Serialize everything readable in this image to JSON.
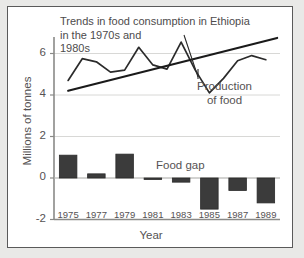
{
  "chart_data": {
    "type": "bar",
    "title": "Trends in food consumption in Ethiopia in the 1970s and 1980s",
    "title_lines": [
      "Trends in food consumption in Ethiopia",
      "in the 1970s and",
      "1980s"
    ],
    "xlabel": "Year",
    "ylabel": "Millions of tonnes",
    "categories": [
      "1975",
      "1977",
      "1979",
      "1981",
      "1983",
      "1985",
      "1987",
      "1989"
    ],
    "ylim": [
      -2,
      7
    ],
    "yticks": [
      -2,
      0,
      2,
      4,
      6
    ],
    "ytick_labels": [
      "-2",
      "0",
      "2",
      "4",
      "6"
    ],
    "grid": true,
    "legend_position": "inline-annotations",
    "series": [
      {
        "name": "Food gap",
        "type": "bar",
        "label": "Food gap",
        "color": "#3b3b3b",
        "categories": [
          "1975",
          "1977",
          "1979",
          "1981",
          "1983",
          "1985",
          "1987",
          "1989"
        ],
        "values": [
          1.1,
          0.2,
          1.15,
          -0.07,
          -0.2,
          -1.5,
          -0.6,
          -1.2
        ]
      },
      {
        "name": "Production of food",
        "type": "line",
        "label": "Production of food",
        "label_lines": [
          "Production",
          "of food"
        ],
        "color": "#2b2b2b",
        "x": [
          1975,
          1976,
          1977,
          1978,
          1979,
          1980,
          1981,
          1982,
          1983,
          1984,
          1985,
          1986,
          1987,
          1988,
          1989
        ],
        "values": [
          4.7,
          5.75,
          5.6,
          5.1,
          5.2,
          6.3,
          5.45,
          5.25,
          6.55,
          5.2,
          4.1,
          4.8,
          5.65,
          5.9,
          5.7
        ]
      },
      {
        "name": "Trend line",
        "type": "line",
        "color": "#1a1a1a",
        "x": [
          1975,
          1989.8
        ],
        "values": [
          4.2,
          6.75
        ]
      }
    ]
  }
}
